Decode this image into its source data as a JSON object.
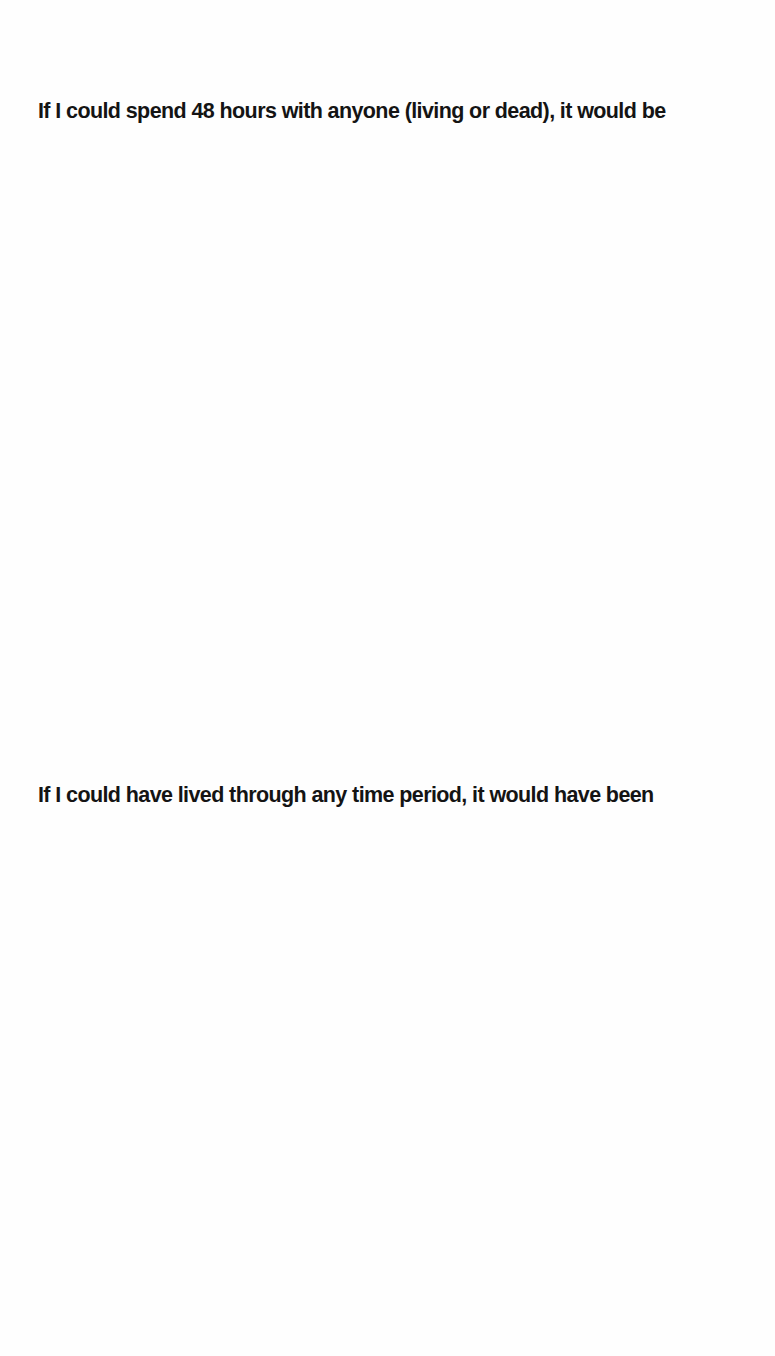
{
  "page": {
    "prompts": [
      {
        "text": "If I could spend 48 hours with anyone (living or dead), it would be",
        "answer": ""
      },
      {
        "text": "If I could have lived through any time period, it would have been",
        "answer": ""
      }
    ]
  }
}
